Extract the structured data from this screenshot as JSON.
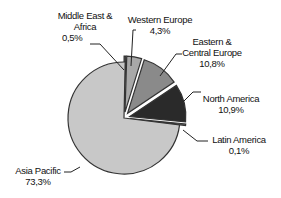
{
  "chart_data": {
    "type": "pie",
    "title": "",
    "categories": [
      "Asia Pacific",
      "Middle East & Africa",
      "Western Europe",
      "Eastern & Central Europe",
      "North America",
      "Latin America"
    ],
    "values": [
      73.3,
      0.5,
      4.3,
      10.8,
      10.9,
      0.1
    ],
    "unit": "%",
    "colors": [
      "#c8c8c8",
      "#4a4a4a",
      "#a8a8a8",
      "#8a8a8a",
      "#2a2a2a",
      "#6a6a6a"
    ],
    "exploded": [
      false,
      true,
      true,
      true,
      true,
      true
    ],
    "legend": "none",
    "data_labels": [
      {
        "name_lines": [
          "Asia Pacific"
        ],
        "value": "73,3%"
      },
      {
        "name_lines": [
          "Middle East &",
          "Africa"
        ],
        "value": "0,5%"
      },
      {
        "name_lines": [
          "Western Europe"
        ],
        "value": "4,3%"
      },
      {
        "name_lines": [
          "Eastern &",
          "Central Europe"
        ],
        "value": "10,8%"
      },
      {
        "name_lines": [
          "North America"
        ],
        "value": "10,9%"
      },
      {
        "name_lines": [
          "Latin America"
        ],
        "value": "0,1%"
      }
    ]
  },
  "labels": {
    "asia": {
      "l1": "Asia Pacific",
      "v": "73,3%"
    },
    "mea": {
      "l1": "Middle East &",
      "l2": "Africa",
      "v": "0,5%"
    },
    "we": {
      "l1": "Western Europe",
      "v": "4,3%"
    },
    "ece": {
      "l1": "Eastern &",
      "l2": "Central Europe",
      "v": "10,8%"
    },
    "na": {
      "l1": "North America",
      "v": "10,9%"
    },
    "la": {
      "l1": "Latin America",
      "v": "0,1%"
    }
  }
}
